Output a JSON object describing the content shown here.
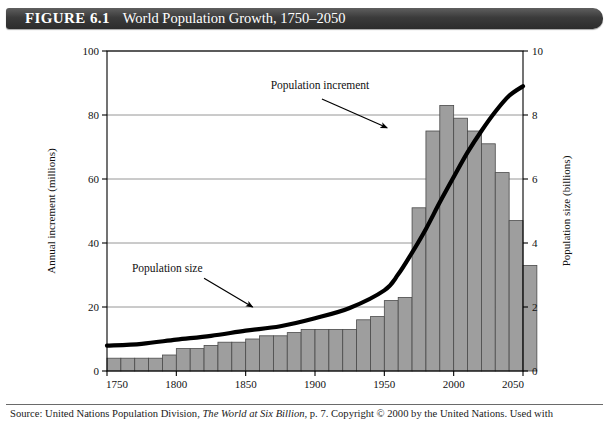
{
  "figure": {
    "label": "FIGURE 6.1",
    "title": "World Population Growth, 1750–2050"
  },
  "source": {
    "prefix": "Source: ",
    "publisher": "United Nations Population Division, ",
    "work": "The World at Six Billion",
    "suffix": ", p. 7. Copyright © 2000 by the United Nations. Used with"
  },
  "colors": {
    "bar_fill": "#9e9e9e",
    "bar_stroke": "#4a4a4a",
    "line": "#000000",
    "grid": "#8a8a8a",
    "axis": "#000000",
    "title_bar": "#3b3b3b",
    "title_text": "#ffffff",
    "background": "#ffffff"
  },
  "chart_data": {
    "type": "bar",
    "title": "World Population Growth, 1750–2050",
    "xlabel": "Year",
    "ylabel": "Annual increment (millions)",
    "y2label": "Population size (billions)",
    "xlim": [
      1750,
      2050
    ],
    "ylim": [
      0,
      100
    ],
    "y2lim": [
      0,
      10
    ],
    "xticks": [
      1750,
      1800,
      1850,
      1900,
      1950,
      2000,
      2050
    ],
    "xticklabels": [
      "1750",
      "1800",
      "1850",
      "1900",
      "1950",
      "2000",
      "2050"
    ],
    "yticks": [
      0,
      20,
      40,
      60,
      80,
      100
    ],
    "yticklabels": [
      "0",
      "20",
      "40",
      "60",
      "80",
      "100"
    ],
    "y2ticks": [
      0,
      2,
      4,
      6,
      8,
      10
    ],
    "y2ticklabels": [
      "0",
      "2",
      "4",
      "6",
      "8",
      "10"
    ],
    "grid": true,
    "grid_axis": "y",
    "legend": "none",
    "annotations": [
      {
        "text": "Population increment",
        "target_series": "Population increment",
        "label_x": 1868,
        "label_y": 88,
        "arrow_from_x": 1905,
        "arrow_from_y": 85,
        "arrow_to_x": 1952,
        "arrow_to_y": 76
      },
      {
        "text": "Population size",
        "target_series": "Population size",
        "label_x": 1768,
        "label_y": 31,
        "arrow_from_x": 1820,
        "arrow_from_y": 29,
        "arrow_to_x": 1855,
        "arrow_to_y": 20
      }
    ],
    "series": [
      {
        "name": "Population increment",
        "type": "bar",
        "axis": "left",
        "unit": "millions per year",
        "bar_width_years": 10,
        "x": [
          1750,
          1760,
          1770,
          1780,
          1790,
          1800,
          1810,
          1820,
          1830,
          1840,
          1850,
          1860,
          1870,
          1880,
          1890,
          1900,
          1910,
          1920,
          1930,
          1940,
          1950,
          1960,
          1970,
          1980,
          1990,
          2000,
          2010,
          2020,
          2030,
          2040
        ],
        "values": [
          4,
          4,
          4,
          4,
          5,
          7,
          7,
          8,
          9,
          9,
          10,
          11,
          11,
          12,
          13,
          13,
          13,
          13,
          16,
          17,
          22,
          23,
          51,
          75,
          83,
          79,
          75,
          71,
          62,
          47
        ],
        "values_tail": [
          33
        ]
      },
      {
        "name": "Population size",
        "type": "line",
        "axis": "right",
        "unit": "billions",
        "x": [
          1750,
          1775,
          1800,
          1825,
          1850,
          1875,
          1900,
          1925,
          1950,
          1960,
          1970,
          1980,
          1990,
          2000,
          2010,
          2020,
          2030,
          2040,
          2050
        ],
        "values": [
          0.79,
          0.85,
          0.98,
          1.1,
          1.26,
          1.4,
          1.65,
          1.97,
          2.52,
          3.02,
          3.7,
          4.44,
          5.27,
          6.06,
          6.83,
          7.5,
          8.1,
          8.6,
          8.9
        ]
      }
    ]
  }
}
